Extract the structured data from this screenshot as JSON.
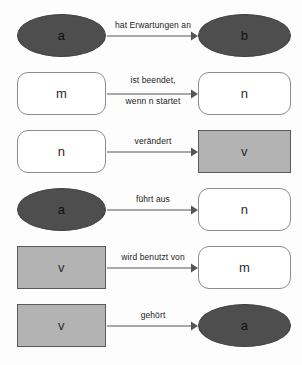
{
  "diagram": {
    "colors": {
      "actor_fill": "#4e4e4e",
      "process_fill": "#ffffff",
      "data_fill": "#b3b3b3",
      "line": "#555555",
      "text": "#1c1c1c",
      "background": "#fdfdfd"
    },
    "legend": {
      "ellipse_means": "Akteur",
      "rounded_rect_means": "Prozess",
      "rect_means": "Daten"
    },
    "rows": [
      {
        "id": "row-1",
        "source": {
          "label": "a",
          "shape": "ellipse"
        },
        "edge": {
          "label_lines": [
            "hat Erwartungen an"
          ],
          "direction": "right",
          "arrow": "solid-triangle"
        },
        "target": {
          "label": "b",
          "shape": "ellipse"
        }
      },
      {
        "id": "row-2",
        "source": {
          "label": "m",
          "shape": "round-rect"
        },
        "edge": {
          "label_lines": [
            "ist beendet,",
            "wenn n startet"
          ],
          "direction": "right",
          "arrow": "solid-triangle"
        },
        "target": {
          "label": "n",
          "shape": "round-rect"
        }
      },
      {
        "id": "row-3",
        "source": {
          "label": "n",
          "shape": "round-rect"
        },
        "edge": {
          "label_lines": [
            "verändert"
          ],
          "direction": "right",
          "arrow": "solid-triangle"
        },
        "target": {
          "label": "v",
          "shape": "rect"
        }
      },
      {
        "id": "row-4",
        "source": {
          "label": "a",
          "shape": "ellipse"
        },
        "edge": {
          "label_lines": [
            "führt aus"
          ],
          "direction": "right",
          "arrow": "solid-triangle"
        },
        "target": {
          "label": "n",
          "shape": "round-rect"
        }
      },
      {
        "id": "row-5",
        "source": {
          "label": "v",
          "shape": "rect"
        },
        "edge": {
          "label_lines": [
            "wird benutzt von"
          ],
          "direction": "right",
          "arrow": "solid-triangle"
        },
        "target": {
          "label": "m",
          "shape": "round-rect"
        }
      },
      {
        "id": "row-6",
        "source": {
          "label": "v",
          "shape": "rect"
        },
        "edge": {
          "label_lines": [
            "gehört"
          ],
          "direction": "right",
          "arrow": "solid-triangle"
        },
        "target": {
          "label": "a",
          "shape": "ellipse"
        }
      }
    ]
  }
}
